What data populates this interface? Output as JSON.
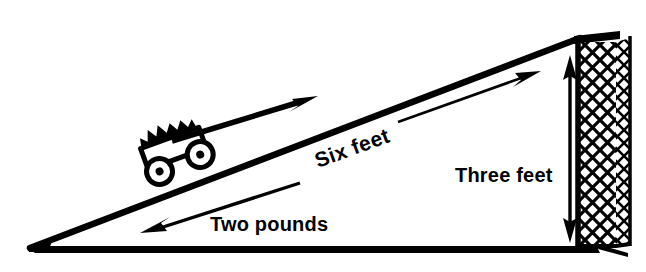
{
  "figure": {
    "kind": "mechanics-diagram",
    "background_color": "#ffffff",
    "ink_color": "#000000",
    "width": 646,
    "height": 272
  },
  "labels": {
    "incline_length": "Six feet",
    "wall_height": "Three feet",
    "applied_force": "Two pounds"
  },
  "annotations": {
    "incline_length_rotation_deg": -20,
    "force_arrow_direction": "up-the-incline",
    "load_arrow_direction": "down-the-incline",
    "height_arrow_direction": "double-headed-vertical"
  },
  "parts": {
    "ramp": "inclined-plane",
    "cart": "loaded-cart-on-ramp",
    "wall": "hatched-vertical-wall",
    "base": "ground-baseline"
  }
}
